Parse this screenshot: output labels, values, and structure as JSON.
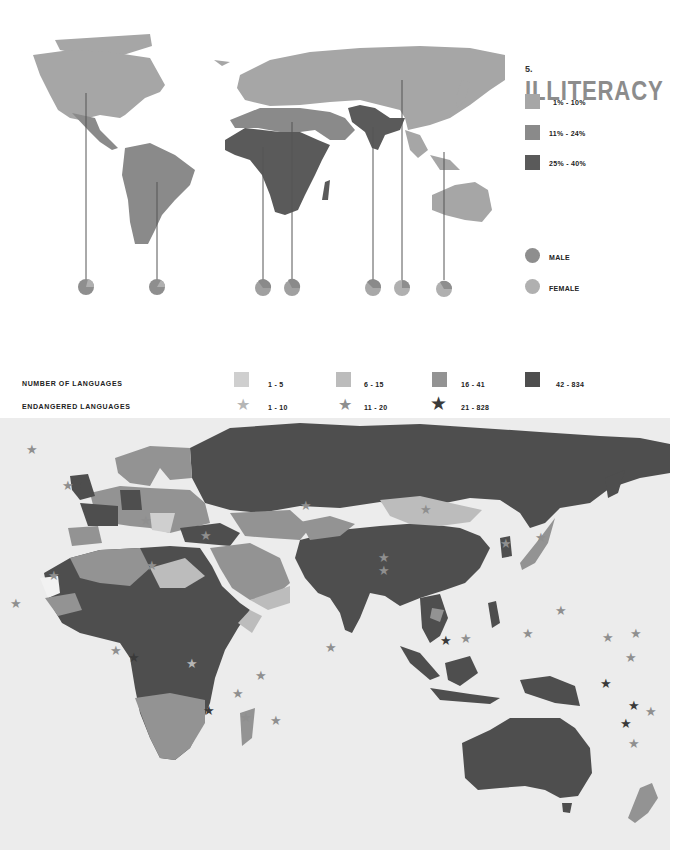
{
  "illiteracy": {
    "number": "5.",
    "title": "ILLITERACY",
    "legend": [
      {
        "label": "1% - 10%",
        "color": "#a6a6a6"
      },
      {
        "label": "11% - 24%",
        "color": "#8a8a8a"
      },
      {
        "label": "25% - 40%",
        "color": "#5a5a5a"
      }
    ],
    "gender_legend": [
      {
        "label": "MALE",
        "color": "#8e8e8e"
      },
      {
        "label": "FEMALE",
        "color": "#b0b0b0"
      }
    ],
    "pies": [
      {
        "region": "north-america",
        "x": 86
      },
      {
        "region": "south-america",
        "x": 157
      },
      {
        "region": "west-africa",
        "x": 263
      },
      {
        "region": "north-east-africa",
        "x": 292
      },
      {
        "region": "south-asia",
        "x": 373
      },
      {
        "region": "east-asia",
        "x": 402
      },
      {
        "region": "oceania",
        "x": 444
      }
    ]
  },
  "languages": {
    "number_heading": "NUMBER OF LANGUAGES",
    "endangered_heading": "ENDANGERED LANGUAGES",
    "number_legend": [
      {
        "label": "1 - 5",
        "color": "#cfcfcf"
      },
      {
        "label": "6 - 15",
        "color": "#bcbcbc"
      },
      {
        "label": "16 - 41",
        "color": "#939393"
      },
      {
        "label": "42 - 834",
        "color": "#4e4e4e"
      }
    ],
    "endangered_legend": [
      {
        "label": "1 - 10",
        "color": "#b5b5b5"
      },
      {
        "label": "11 - 20",
        "color": "#8f8f8f"
      },
      {
        "label": "21 - 828",
        "color": "#3a3a3a"
      }
    ]
  },
  "icons": {
    "star": "★"
  }
}
